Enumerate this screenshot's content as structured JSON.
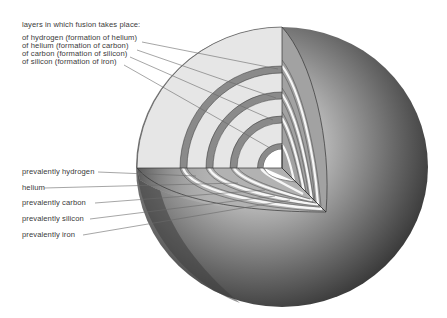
{
  "diagram": {
    "title": "layers in which fusion takes place:",
    "fusion_layers": [
      {
        "label": "of hydrogen (formation of helium)"
      },
      {
        "label": "of helium (formation of carbon)"
      },
      {
        "label": "of carbon (formation of silicon)"
      },
      {
        "label": "of silicon (formation of iron)"
      }
    ],
    "composition_layers": [
      {
        "label": "prevalently hydrogen"
      },
      {
        "label": "helium"
      },
      {
        "label": "prevalently carbon"
      },
      {
        "label": "prevalently silicon"
      },
      {
        "label": "prevalently iron"
      }
    ],
    "colors": {
      "front_face": "#e6e6e6",
      "ring": "#8c8c8c",
      "side_face": "#a4a4a4",
      "bottom_face": "#b4b4b4",
      "sphere_dark": "#3c3c3c",
      "sphere_light": "#d4d4d4",
      "core": "#ffffff",
      "label_text": "#3a3a3a"
    }
  }
}
